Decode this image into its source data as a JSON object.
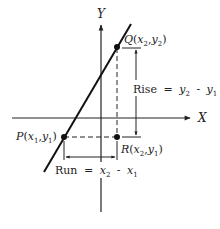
{
  "diagram": {
    "axes": {
      "x_label": "X",
      "y_label": "Y"
    },
    "points": {
      "P": {
        "name": "P",
        "x_sub": "1",
        "y_sub": "1"
      },
      "Q": {
        "name": "Q",
        "x_sub": "2",
        "y_sub": "2"
      },
      "R": {
        "name": "R",
        "x_sub": "2",
        "y_sub": "1"
      }
    },
    "rise": {
      "word": "Rise",
      "eq": "=",
      "a": "y",
      "a_sub": "2",
      "minus": "-",
      "b": "y",
      "b_sub": "1"
    },
    "run": {
      "word": "Run",
      "eq": "=",
      "a": "x",
      "a_sub": "2",
      "minus": "-",
      "b": "x",
      "b_sub": "1"
    },
    "colors": {
      "ink": "#222222",
      "background": "#ffffff"
    }
  }
}
